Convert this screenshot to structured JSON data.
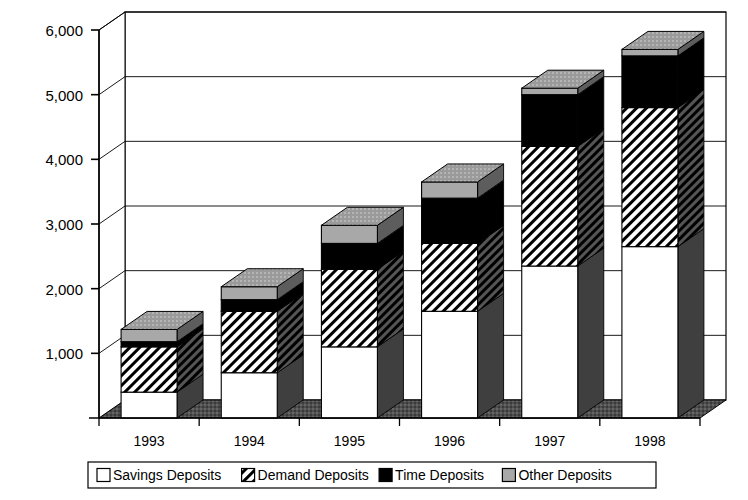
{
  "chart_data": {
    "type": "bar",
    "subtype": "stacked-column-3d",
    "title": "",
    "xlabel": "",
    "ylabel": "",
    "categories": [
      "1993",
      "1994",
      "1995",
      "1996",
      "1997",
      "1998"
    ],
    "ylim": [
      0,
      6000
    ],
    "ytick_values": [
      1000,
      2000,
      3000,
      4000,
      5000,
      6000
    ],
    "ytick_labels": [
      "1,000",
      "2,000",
      "3,000",
      "4,000",
      "5,000",
      "6,000"
    ],
    "grid": true,
    "legend_position": "bottom",
    "series": [
      {
        "name": "Savings Deposits",
        "fill": "white",
        "color": "#ffffff",
        "values": [
          400,
          700,
          1100,
          1650,
          2350,
          2650
        ]
      },
      {
        "name": "Demand Deposits",
        "fill": "diagonal-hatch",
        "color": "#ffffff",
        "values": [
          700,
          950,
          1200,
          1050,
          1850,
          2150
        ]
      },
      {
        "name": "Time Deposits",
        "fill": "solid-black",
        "color": "#000000",
        "values": [
          80,
          180,
          400,
          700,
          800,
          800
        ]
      },
      {
        "name": "Other Deposits",
        "fill": "solid-gray",
        "color": "#a8a8a8",
        "values": [
          190,
          200,
          280,
          250,
          100,
          100
        ]
      }
    ],
    "totals": [
      1370,
      2030,
      2980,
      3650,
      5100,
      5700
    ]
  },
  "legend": {
    "items": [
      {
        "label": "Savings Deposits",
        "swatch": "white"
      },
      {
        "label": "Demand Deposits",
        "swatch": "hatch"
      },
      {
        "label": "Time Deposits",
        "swatch": "black"
      },
      {
        "label": "Other Deposits",
        "swatch": "gray"
      }
    ]
  },
  "axes": {
    "y_labels": [
      "6,000",
      "5,000",
      "4,000",
      "3,000",
      "2,000",
      "1,000"
    ],
    "x_labels": [
      "1993",
      "1994",
      "1995",
      "1996",
      "1997",
      "1998"
    ]
  },
  "colors": {
    "black": "#000000",
    "gray": "#a8a8a8",
    "dark_gray": "#3d3d3d",
    "floor": "#4a4a4a",
    "white": "#ffffff"
  }
}
